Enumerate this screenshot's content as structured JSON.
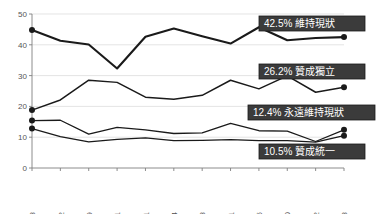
{
  "chart_data": {
    "type": "line",
    "title": "",
    "xlabel": "",
    "ylabel": "",
    "ylim": [
      0,
      50
    ],
    "yticks": [
      0,
      10,
      20,
      30,
      40,
      50
    ],
    "grid": true,
    "legend_position": "inline-right-callouts",
    "categories": [
      "2006/8",
      "2006/12",
      "2007/9",
      "2007/11",
      "2008/1",
      "2008/4",
      "2008/8",
      "2008/11",
      "2009/5",
      "2009/10",
      "2009/12",
      "2010/3"
    ],
    "series": [
      {
        "name": "維持現狀",
        "final_value": 42.5,
        "final_label": "42.5% 維持現狀",
        "values": [
          44.8,
          41.3,
          40.1,
          32.3,
          42.6,
          45.3,
          42.8,
          40.4,
          45.7,
          41.5,
          42.2,
          42.5
        ]
      },
      {
        "name": "贊成獨立",
        "final_value": 26.2,
        "final_label": "26.2% 贊成獨立",
        "values": [
          18.8,
          22.1,
          28.5,
          27.8,
          23.0,
          22.3,
          23.6,
          28.5,
          25.7,
          29.9,
          24.6,
          26.2
        ]
      },
      {
        "name": "永遠維持現狀",
        "final_value": 12.4,
        "final_label": "12.4% 永遠維持現狀",
        "values": [
          15.4,
          15.5,
          11.0,
          13.2,
          12.4,
          11.2,
          11.4,
          14.5,
          12.1,
          12.0,
          8.6,
          12.4
        ]
      },
      {
        "name": "贊成統一",
        "final_value": 10.5,
        "final_label": "10.5% 贊成統一",
        "values": [
          12.8,
          10.2,
          8.5,
          9.3,
          9.8,
          8.9,
          9.0,
          9.2,
          8.9,
          8.9,
          8.4,
          10.5
        ]
      }
    ],
    "callouts": [
      {
        "text": "42.5% 維持現狀",
        "x": 259,
        "y": 16,
        "w": 106,
        "h": 15
      },
      {
        "text": "26.2% 贊成獨立",
        "x": 259,
        "y": 64,
        "w": 106,
        "h": 15
      },
      {
        "text": "12.4% 永遠維持現狀",
        "x": 248,
        "y": 105,
        "w": 127,
        "h": 15
      },
      {
        "text": "10.5% 贊成統一",
        "x": 259,
        "y": 144,
        "w": 106,
        "h": 15
      }
    ]
  }
}
